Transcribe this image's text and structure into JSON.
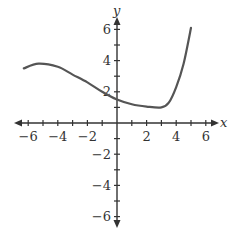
{
  "chart_data": {
    "type": "line",
    "title": "",
    "xlabel": "x",
    "ylabel": "y",
    "xlim": [
      -6.5,
      6.5
    ],
    "ylim": [
      -6.5,
      6.5
    ],
    "grid": false,
    "legend": null,
    "x_ticks": [
      -6,
      -5,
      -4,
      -3,
      -2,
      -1,
      1,
      2,
      3,
      4,
      5,
      6
    ],
    "y_ticks": [
      -6,
      -5,
      -4,
      -3,
      -2,
      -1,
      1,
      2,
      3,
      4,
      5,
      6
    ],
    "x_tick_labels": [
      {
        "value": -6,
        "label": "−6"
      },
      {
        "value": -4,
        "label": "−4"
      },
      {
        "value": -2,
        "label": "−2"
      },
      {
        "value": 2,
        "label": "2"
      },
      {
        "value": 4,
        "label": "4"
      },
      {
        "value": 6,
        "label": "6"
      }
    ],
    "y_tick_labels": [
      {
        "value": 6,
        "label": "6"
      },
      {
        "value": 4,
        "label": "4"
      },
      {
        "value": 2,
        "label": "2"
      },
      {
        "value": -2,
        "label": "−2"
      },
      {
        "value": -4,
        "label": "−4"
      },
      {
        "value": -6,
        "label": "−6"
      }
    ],
    "series": [
      {
        "name": "f(x)",
        "x": [
          -6.3,
          -5.3,
          -4,
          -3,
          -2,
          -1,
          0,
          1,
          2,
          3,
          3.5,
          4,
          4.5,
          5
        ],
        "y": [
          3.5,
          3.8,
          3.6,
          3.1,
          2.6,
          2.0,
          1.5,
          1.2,
          1.05,
          1.0,
          1.3,
          2.3,
          3.8,
          6.1
        ]
      }
    ],
    "colors": {
      "axis": "#333333",
      "curve": "#555555"
    }
  }
}
